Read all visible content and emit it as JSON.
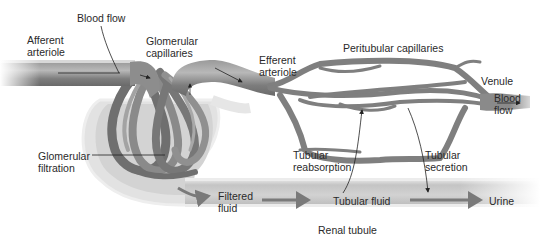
{
  "diagram": {
    "type": "anatomy",
    "colors": {
      "vessel_dark": "#6e6e6e",
      "vessel_mid": "#8c8c8c",
      "vessel_light": "#bdbdbd",
      "capsule": "#d6d6d6",
      "capsule_edge": "#e8e8e8",
      "tubule": "#c9c9c9",
      "arrow": "#222222",
      "flow_arrow": "#7a7a7a",
      "text": "#2a2a2a"
    }
  },
  "labels": {
    "blood_flow_top": "Blood flow",
    "afferent_arteriole": "Afferent\narteriole",
    "glomerular_capillaries": "Glomerular\ncapillaries",
    "efferent_arteriole": "Efferent\narteriole",
    "peritubular_capillaries": "Peritubular capillaries",
    "venule": "Venule",
    "blood_flow_right": "Blood\nflow",
    "glomerular_filtration": "Glomerular\nfiltration",
    "tubular_reabsorption": "Tubular\nreabsorption",
    "tubular_secretion": "Tubular\nsecretion",
    "filtered_fluid": "Filtered\nfluid",
    "tubular_fluid": "Tubular fluid",
    "urine": "Urine",
    "renal_tubule": "Renal tubule"
  }
}
